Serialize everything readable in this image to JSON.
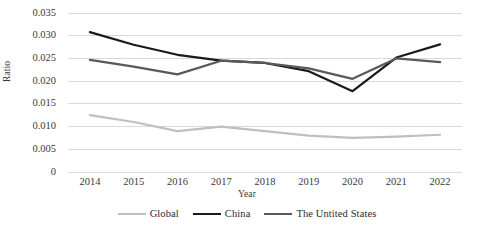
{
  "chart_data": {
    "type": "line",
    "title": "",
    "xlabel": "Year",
    "ylabel": "Ratio",
    "categories": [
      "2014",
      "2015",
      "2016",
      "2017",
      "2018",
      "2019",
      "2020",
      "2021",
      "2022"
    ],
    "x": [
      2014,
      2015,
      2016,
      2017,
      2018,
      2019,
      2020,
      2021,
      2022
    ],
    "ylim": [
      0,
      0.035
    ],
    "yticks": [
      0,
      0.005,
      0.01,
      0.015,
      0.02,
      0.025,
      0.03,
      0.035
    ],
    "ytick_labels": [
      "0",
      "0.005",
      "0.010",
      "0.015",
      "0.020",
      "0.025",
      "0.030",
      "0.035"
    ],
    "grid": true,
    "grid_axis": "y",
    "legend_position": "bottom",
    "series": [
      {
        "name": "Global",
        "color": "#bfbfbf",
        "values": [
          0.0125,
          0.011,
          0.009,
          0.01,
          0.009,
          0.008,
          0.0075,
          0.0078,
          0.0082
        ]
      },
      {
        "name": "China",
        "color": "#1a1a1a",
        "values": [
          0.0308,
          0.028,
          0.0258,
          0.0245,
          0.024,
          0.0222,
          0.0178,
          0.0252,
          0.0281
        ]
      },
      {
        "name": "The Untited States",
        "color": "#595959",
        "values": [
          0.0247,
          0.0232,
          0.0215,
          0.0245,
          0.024,
          0.0228,
          0.0205,
          0.025,
          0.0242
        ]
      }
    ]
  },
  "style": {
    "grid_color": "#d9d9d9",
    "text_color": "#3a3a3a",
    "background": "#ffffff",
    "line_width": 2.2
  }
}
